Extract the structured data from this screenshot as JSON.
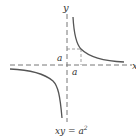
{
  "diagram": {
    "axes": {
      "x_label": "x",
      "y_label": "y",
      "style": "dashed",
      "color": "#666666"
    },
    "labels": {
      "a_vertical": "a",
      "a_horizontal": "a"
    },
    "curve": {
      "equation_lhs": "xy = a",
      "equation_exp": "2",
      "color": "#555555",
      "branches": [
        "first-quadrant",
        "third-quadrant"
      ]
    },
    "reference_square": {
      "corner": "(a, a)",
      "style": "dashed"
    }
  }
}
